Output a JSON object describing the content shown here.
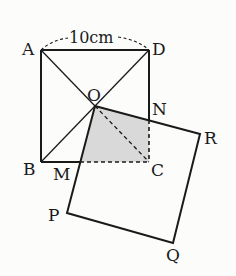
{
  "diagram": {
    "dimension_label": "10cm",
    "labels": {
      "A": "A",
      "B": "B",
      "C": "C",
      "D": "D",
      "O": "O",
      "N": "N",
      "M": "M",
      "P": "P",
      "Q": "Q",
      "R": "R"
    },
    "points": {
      "A": [
        41,
        50
      ],
      "D": [
        149,
        50
      ],
      "B": [
        41,
        162
      ],
      "C": [
        149,
        162
      ],
      "O": [
        95,
        106
      ],
      "N": [
        149,
        120
      ],
      "M": [
        80,
        162
      ],
      "R": [
        200,
        134
      ],
      "P": [
        67,
        213
      ],
      "Q": [
        173,
        243
      ]
    },
    "colors": {
      "stroke": "#1a1a1a",
      "shaded": "#d9d9d9",
      "background": "#fcfcfa"
    },
    "shaded_region": "O-N-C-M"
  }
}
